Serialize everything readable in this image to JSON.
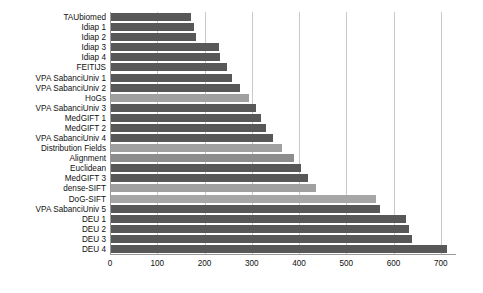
{
  "chart_data": {
    "type": "bar",
    "orientation": "horizontal",
    "title": "",
    "subtitle": "",
    "xlabel": "",
    "ylabel": "",
    "xlim": [
      0,
      730
    ],
    "ylim": null,
    "grid": true,
    "legend": null,
    "legend_position": "none",
    "xticks": [
      0,
      100,
      200,
      300,
      400,
      500,
      600,
      700
    ],
    "xtick_labels": [
      "0",
      "100",
      "200",
      "300",
      "400",
      "500",
      "600",
      "700"
    ],
    "categories": [
      "TAUbiomed",
      "Idiap 1",
      "Idiap 2",
      "Idiap 3",
      "Idiap 4",
      "FEITIJS",
      "VPA SabanciUniv 1",
      "VPA SabanciUniv 2",
      "HoGs",
      "VPA SabanciUniv 3",
      "MedGIFT 1",
      "MedGIFT 2",
      "VPA SabanciUniv 4",
      "Distribution Fields",
      "Alignment",
      "Euclidean",
      "MedGIFT 3",
      "dense-SIFT",
      "DoG-SIFT",
      "VPA SabanciUniv 5",
      "DEU 1",
      "DEU 2",
      "DEU 3",
      "DEU 4"
    ],
    "values": [
      171,
      177,
      181,
      230,
      232,
      248,
      258,
      275,
      295,
      308,
      320,
      330,
      345,
      363,
      390,
      405,
      420,
      435,
      563,
      571,
      626,
      632,
      640,
      714
    ],
    "bar_colors": [
      "#585858",
      "#585858",
      "#585858",
      "#585858",
      "#585858",
      "#585858",
      "#585858",
      "#585858",
      "#a0a0a0",
      "#585858",
      "#585858",
      "#585858",
      "#585858",
      "#a0a0a0",
      "#8d8d8d",
      "#585858",
      "#585858",
      "#a0a0a0",
      "#a6a6a6",
      "#585858",
      "#585858",
      "#585858",
      "#585858",
      "#585858"
    ]
  },
  "colors": {
    "background": "#ffffff",
    "bar_dark": "#585858",
    "bar_light": "#a0a0a0",
    "gridline": "#c9c9c9",
    "axis": "#9a9a9a",
    "text": "#111111"
  }
}
